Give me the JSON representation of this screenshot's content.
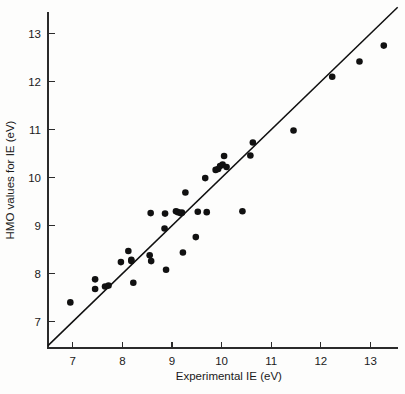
{
  "chart_data": {
    "type": "scatter",
    "title": "",
    "xlabel": "Experimental IE (eV)",
    "ylabel": "HMO values for IE (eV)",
    "xlim": [
      6.5,
      13.55
    ],
    "ylim": [
      6.45,
      13.45
    ],
    "xticks": [
      7,
      8,
      9,
      10,
      11,
      12,
      13
    ],
    "xticklabels": [
      "7",
      "8",
      "9",
      "10",
      "11",
      "12",
      "13"
    ],
    "yticks": [
      7,
      8,
      9,
      10,
      11,
      12,
      13
    ],
    "yticklabels": [
      "7",
      "8",
      "9",
      "10",
      "11",
      "12",
      "13"
    ],
    "grid": false,
    "legend": null,
    "marker": "filled-circle",
    "marker_color": "#111111",
    "reference_line": {
      "description": "y = x identity line",
      "x": [
        6.5,
        13.55
      ],
      "y": [
        6.5,
        13.55
      ],
      "color": "#101010"
    },
    "x": [
      6.95,
      7.45,
      7.45,
      7.65,
      7.72,
      7.97,
      8.12,
      8.18,
      8.18,
      8.22,
      8.55,
      8.57,
      8.58,
      8.85,
      8.86,
      8.88,
      9.08,
      9.12,
      9.17,
      9.2,
      9.22,
      9.27,
      9.48,
      9.52,
      9.67,
      9.7,
      9.88,
      9.93,
      9.97,
      10.02,
      10.05,
      10.1,
      10.42,
      10.58,
      10.63,
      11.45,
      12.23,
      12.78,
      13.27
    ],
    "y": [
      7.4,
      7.88,
      7.68,
      7.73,
      7.75,
      8.24,
      8.47,
      8.26,
      8.29,
      7.81,
      8.38,
      9.26,
      8.26,
      8.94,
      9.25,
      8.08,
      9.3,
      9.28,
      9.26,
      9.27,
      8.44,
      9.69,
      8.76,
      9.29,
      9.99,
      9.28,
      10.16,
      10.18,
      10.24,
      10.27,
      10.45,
      10.22,
      9.3,
      10.46,
      10.73,
      10.98,
      12.1,
      12.42,
      12.75
    ],
    "n_points": 39
  },
  "geometry": {
    "plot_left_px": 48,
    "plot_bottom_px": 348,
    "px_per_unit_x": 49.6,
    "px_per_unit_y": 48.0
  }
}
